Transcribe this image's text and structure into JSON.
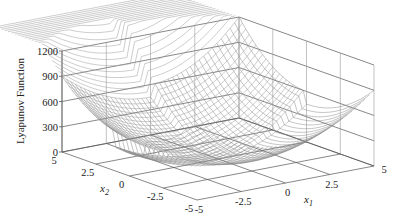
{
  "chart_data": {
    "type": "surface3d",
    "title": "",
    "zlabel": "Lyapunov Function",
    "xlabel": "x1",
    "ylabel": "x2",
    "x1_ticks": [
      "-5",
      "-2.5",
      "0",
      "2.5",
      "5"
    ],
    "x2_ticks": [
      "5",
      "2.5",
      "0",
      "-2.5",
      "-5"
    ],
    "z_ticks": [
      "0",
      "300",
      "600",
      "900",
      "1200"
    ],
    "x1_range": [
      -5,
      5
    ],
    "x2_range": [
      -5,
      5
    ],
    "zlim": [
      0,
      1200
    ],
    "grid": true,
    "surface": {
      "description": "Piecewise quadratic bowl with minimum near origin (0); value ~900 at corner (x1=-5,x2=5), ~1200 at back corner (x1=5? peak region), ~600 at right corner, with a discontinuous raised sector visible as vertical walls near x1<0.",
      "corner_values": {
        "x1=-5,x2=5": 900,
        "x1=5,x2=5": 1200,
        "x1=5,x2=-5": 600,
        "x1=-5,x2=-5": 300
      },
      "min_value": 0
    }
  },
  "labels": {
    "zlabel": "Lyapunov Function",
    "x1": "x",
    "x1_sub": "1",
    "x2": "x",
    "x2_sub": "2"
  }
}
